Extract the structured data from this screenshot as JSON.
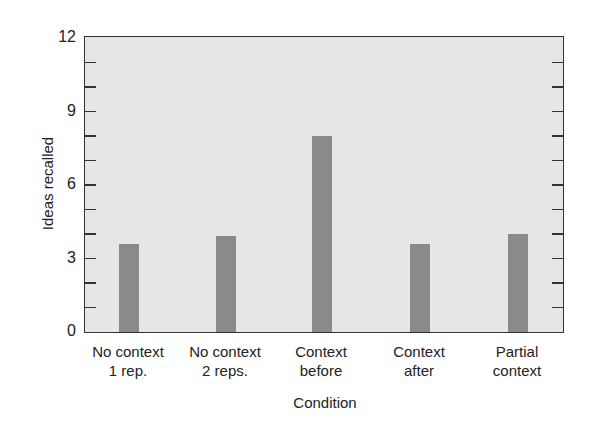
{
  "chart_data": {
    "type": "bar",
    "title": "",
    "xlabel": "Condition",
    "ylabel": "Ideas recalled",
    "ylim": [
      0,
      12
    ],
    "yticks": [
      0,
      3,
      6,
      9,
      12
    ],
    "minor_ytick_step": 1,
    "grid": false,
    "legend": null,
    "categories": [
      "No context\n1 rep.",
      "No context\n2 reps.",
      "Context\nbefore",
      "Context\nafter",
      "Partial\ncontext"
    ],
    "values": [
      3.6,
      3.9,
      8.0,
      3.6,
      4.0
    ],
    "colors": {
      "bar": "#8a8a8a",
      "plot_background": "#e6e6e6",
      "frame": "#333333"
    }
  },
  "labels": {
    "xlabel": "Condition",
    "ylabel": "Ideas recalled",
    "yticks": [
      "0",
      "3",
      "6",
      "9",
      "12"
    ],
    "cats": [
      {
        "l1": "No context",
        "l2": "1 rep."
      },
      {
        "l1": "No context",
        "l2": "2 reps."
      },
      {
        "l1": "Context",
        "l2": "before"
      },
      {
        "l1": "Context",
        "l2": "after"
      },
      {
        "l1": "Partial",
        "l2": "context"
      }
    ]
  }
}
